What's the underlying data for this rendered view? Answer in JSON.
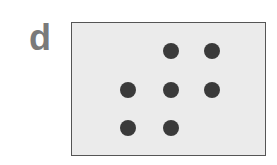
{
  "figure": {
    "panel_label": "d",
    "panel_background": "#ebebeb",
    "dot_color": "#3a3a3a",
    "dot_count": 7,
    "dots": [
      {
        "row": 1,
        "col": 2
      },
      {
        "row": 1,
        "col": 3
      },
      {
        "row": 2,
        "col": 1
      },
      {
        "row": 2,
        "col": 2
      },
      {
        "row": 2,
        "col": 3
      },
      {
        "row": 3,
        "col": 1
      },
      {
        "row": 3,
        "col": 2
      }
    ]
  }
}
